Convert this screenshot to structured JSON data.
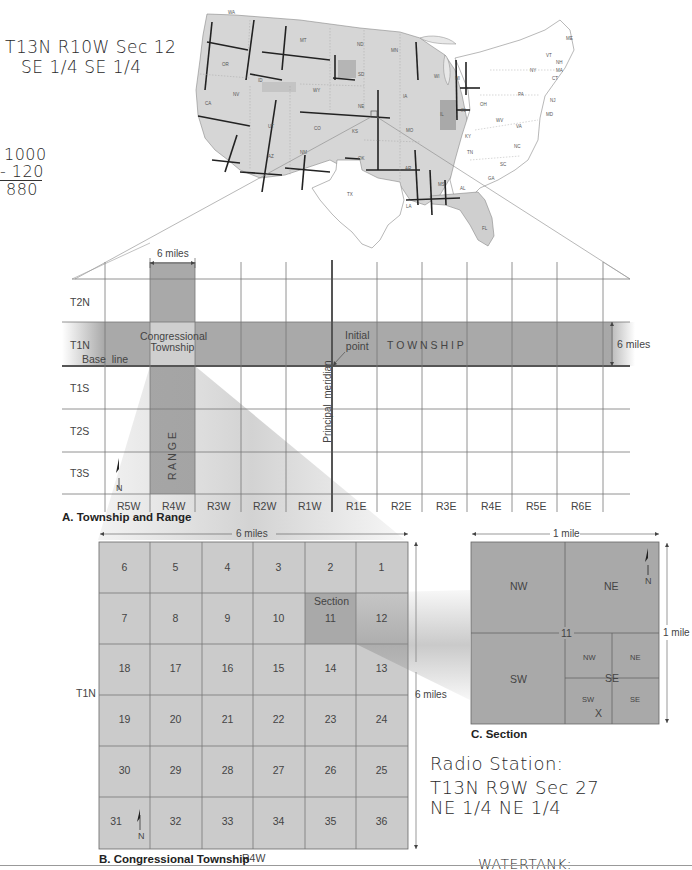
{
  "annotations": {
    "top_left": {
      "line1": "T13N R10W Sec 12",
      "line2": "SE 1/4 SE 1/4"
    },
    "subtraction": {
      "a": "1000",
      "b": "- 120",
      "result": "880"
    },
    "radio_station": {
      "title": "Radio Station:",
      "line1": "T13N R9W Sec 27",
      "line2": "NE 1/4 NE 1/4"
    },
    "bottom_cut": "WATERTANK:"
  },
  "us_map": {
    "states": [
      "WA",
      "OR",
      "CA",
      "NV",
      "ID",
      "MT",
      "WY",
      "UT",
      "AZ",
      "NM",
      "CO",
      "ND",
      "SD",
      "NE",
      "KS",
      "OK",
      "TX",
      "MN",
      "IA",
      "MO",
      "AR",
      "LA",
      "WI",
      "IL",
      "MI",
      "IN",
      "OH",
      "KY",
      "TN",
      "MS",
      "AL",
      "GA",
      "FL",
      "SC",
      "NC",
      "VA",
      "WV",
      "PA",
      "NY",
      "VT",
      "NH",
      "ME",
      "MA",
      "CT",
      "NJ",
      "MD",
      "DE"
    ],
    "line_labels": [
      "Base Line",
      "Meridian"
    ]
  },
  "panel_a": {
    "caption": "A. Township and Range",
    "width_label": "6 miles",
    "height_label": "6 miles",
    "township_rows": [
      "T2N",
      "T1N",
      "T1S",
      "T2S",
      "T3S"
    ],
    "range_cols": [
      "R5W",
      "R4W",
      "R3W",
      "R2W",
      "R1W",
      "R1E",
      "R2E",
      "R3E",
      "R4E",
      "R5E",
      "R6E"
    ],
    "base_line_label": "Base  line",
    "congressional_label_1": "Congressional",
    "congressional_label_2": "Township",
    "initial_point_1": "Initial",
    "initial_point_2": "point",
    "township_word": "T O W N S H I P",
    "range_word": "R A N G E",
    "meridian_label": "Principal  meridian",
    "north_label": "N"
  },
  "panel_b": {
    "caption": "B. Congressional Township",
    "width_label": "6 miles",
    "height_label": "6 miles",
    "row_label": "T1N",
    "col_label": "R4W",
    "section_label": "Section",
    "highlighted_section": "11",
    "north_label": "N",
    "rows": [
      [
        "6",
        "5",
        "4",
        "3",
        "2",
        "1"
      ],
      [
        "7",
        "8",
        "9",
        "10",
        "11",
        "12"
      ],
      [
        "18",
        "17",
        "16",
        "15",
        "14",
        "13"
      ],
      [
        "19",
        "20",
        "21",
        "22",
        "23",
        "24"
      ],
      [
        "30",
        "29",
        "28",
        "27",
        "26",
        "25"
      ],
      [
        "31",
        "32",
        "33",
        "34",
        "35",
        "36"
      ]
    ]
  },
  "panel_c": {
    "caption": "C. Section",
    "width_label": "1 mile",
    "height_label": "1 mile",
    "section_number": "11",
    "quarters": {
      "nw": "NW",
      "ne": "NE",
      "sw": "SW",
      "se": "SE"
    },
    "sub_quarters": {
      "nw": "NW",
      "ne": "NE",
      "sw": "SW",
      "se": "SE"
    },
    "marker": "X",
    "north_label": "N"
  },
  "colors": {
    "shade_dark": "#a8a8a8",
    "shade_light": "#cfcfcf",
    "section_grid": "#c9c9c9",
    "section_highlight": "#a9a9a9",
    "section_c": "#a7a7a7",
    "line": "#555555",
    "map_fill": "#d6d6d6"
  }
}
